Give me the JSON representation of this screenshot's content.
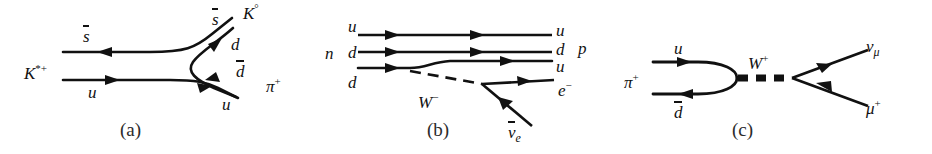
{
  "figure": {
    "background_color": "#ffffff",
    "line_color": "#111111",
    "width": 932,
    "height": 154
  },
  "panels": [
    {
      "id": "a",
      "caption": "(a)",
      "process": "K*+ -> K0 pi+",
      "labels": {
        "incoming_hadron": "K",
        "incoming_hadron_sup": "*+",
        "antistrange_in": "s",
        "up_in": "u",
        "antistrange_out": "s",
        "down_out": "d",
        "antidown_out": "d",
        "up_out": "u",
        "outgoing_kaon": "K",
        "outgoing_kaon_sup": "°",
        "outgoing_pion": "π",
        "outgoing_pion_sup": "+"
      }
    },
    {
      "id": "b",
      "caption": "(b)",
      "process": "n -> p e- anti-nu_e",
      "labels": {
        "neutron": "n",
        "proton": "p",
        "quark_in_1": "u",
        "quark_in_2": "d",
        "quark_in_3": "d",
        "quark_out_1": "u",
        "quark_out_2": "d",
        "quark_out_3": "u",
        "boson": "W",
        "boson_sup": "−",
        "electron": "e",
        "electron_sup": "−",
        "antineutrino": "ν",
        "antineutrino_sub": "e"
      }
    },
    {
      "id": "c",
      "caption": "(c)",
      "process": "pi+ -> mu+ nu_mu",
      "labels": {
        "pion": "π",
        "pion_sup": "+",
        "up_quark": "u",
        "antidown_quark": "d",
        "boson": "W",
        "boson_sup": "+",
        "neutrino": "ν",
        "neutrino_sub": "μ",
        "muon": "μ",
        "muon_sup": "+"
      }
    }
  ]
}
